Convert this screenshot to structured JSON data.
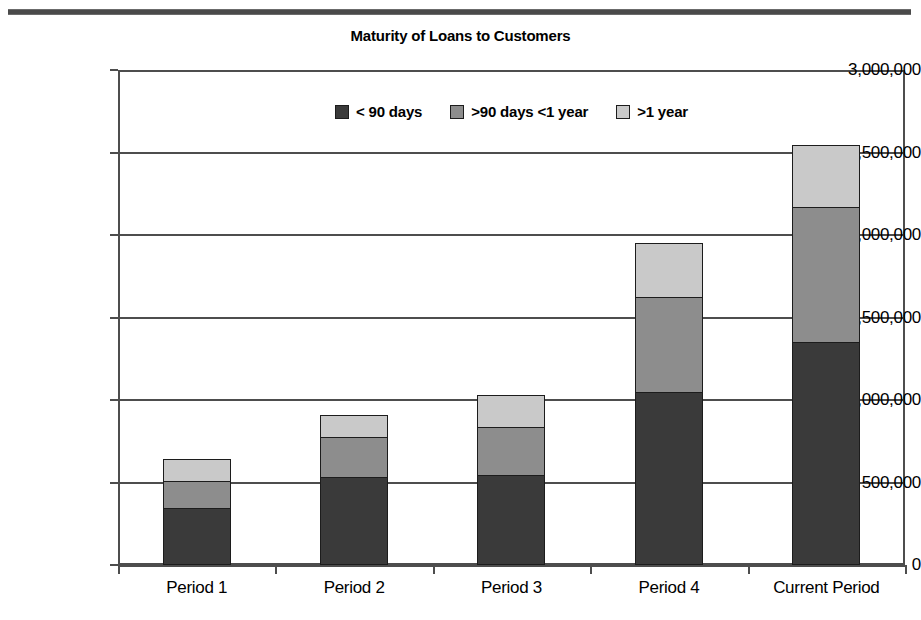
{
  "chart_data": {
    "type": "bar",
    "subtype": "stacked-bar",
    "title": "Maturity of Loans to Customers",
    "xlabel": "",
    "ylabel": "",
    "ylim": [
      0,
      3000000
    ],
    "ytick_labels": [
      "3,000,000",
      "2,500,000",
      "2,000,000",
      "1,500,000",
      "1,000,000",
      "500,000",
      "0"
    ],
    "ytick_values": [
      3000000,
      2500000,
      2000000,
      1500000,
      1000000,
      500000,
      0
    ],
    "grid": true,
    "legend_position": "top-center",
    "categories": [
      "Period 1",
      "Period 2",
      "Period 3",
      "Period 4",
      "Current Period"
    ],
    "series": [
      {
        "name": "< 90 days",
        "color": "#3a3a3a",
        "values": [
          345000,
          535000,
          545000,
          1050000,
          1350000
        ]
      },
      {
        "name": ">90 days <1 year",
        "color": "#8d8d8d",
        "values": [
          165000,
          240000,
          290000,
          575000,
          820000
        ]
      },
      {
        "name": ">1 year",
        "color": "#c9c9c9",
        "values": [
          135000,
          135000,
          195000,
          325000,
          375000
        ]
      }
    ],
    "totals": [
      645000,
      910000,
      1030000,
      1950000,
      2545000
    ]
  },
  "legend": {
    "items": [
      {
        "label": "< 90 days"
      },
      {
        "label": ">90 days <1 year"
      },
      {
        "label": ">1 year"
      }
    ]
  }
}
